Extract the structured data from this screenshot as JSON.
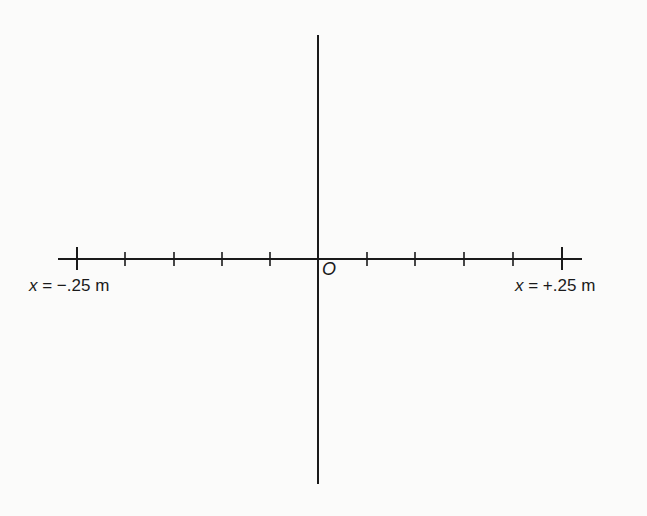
{
  "diagram": {
    "type": "coordinate-axes",
    "origin_label": "O",
    "left_label": {
      "var": "x",
      "text": " = −.25 m"
    },
    "right_label": {
      "var": "x",
      "text": " = +.25 m"
    },
    "x_axis": {
      "min_m": -0.25,
      "max_m": 0.25,
      "tick_count_each_side": 5,
      "tick_spacing_m": 0.05
    },
    "colors": {
      "line": "#1a1a1a",
      "background": "#fbfbfa"
    }
  }
}
